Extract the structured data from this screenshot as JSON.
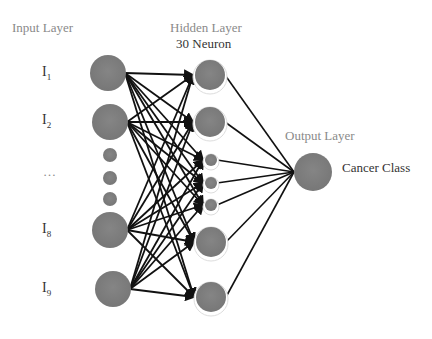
{
  "labels": {
    "input_layer": "Input Layer",
    "hidden_layer": "Hidden Layer",
    "hidden_count": "30 Neuron",
    "output_layer": "Output Layer",
    "output_class": "Cancer Class"
  },
  "inputs": [
    {
      "label": "I",
      "sub": "1"
    },
    {
      "label": "I",
      "sub": "2"
    },
    {
      "label": "…",
      "sub": ""
    },
    {
      "label": "I",
      "sub": "8"
    },
    {
      "label": "I",
      "sub": "9"
    }
  ],
  "colors": {
    "node": "#7f7f7f",
    "edge": "#111111",
    "label_gray": "#8a8a8a"
  },
  "nodes": {
    "input": [
      {
        "cx": 108,
        "cy": 73,
        "r": 18
      },
      {
        "cx": 110,
        "cy": 122,
        "r": 18
      },
      {
        "cx": 110,
        "cy": 155,
        "r": 7
      },
      {
        "cx": 110,
        "cy": 178,
        "r": 7
      },
      {
        "cx": 110,
        "cy": 199,
        "r": 7
      },
      {
        "cx": 110,
        "cy": 230,
        "r": 18
      },
      {
        "cx": 113,
        "cy": 289,
        "r": 18
      }
    ],
    "hidden": [
      {
        "cx": 210,
        "cy": 75,
        "r": 15
      },
      {
        "cx": 210,
        "cy": 122,
        "r": 15
      },
      {
        "cx": 211,
        "cy": 160,
        "r": 6
      },
      {
        "cx": 211,
        "cy": 183,
        "r": 6
      },
      {
        "cx": 211,
        "cy": 205,
        "r": 6
      },
      {
        "cx": 211,
        "cy": 242,
        "r": 15
      },
      {
        "cx": 211,
        "cy": 297,
        "r": 15
      }
    ],
    "output": {
      "cx": 313,
      "cy": 172,
      "r": 19
    }
  }
}
